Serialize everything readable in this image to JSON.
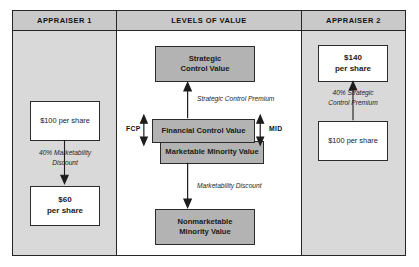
{
  "diagram": {
    "title": "Levels of Value",
    "columns": {
      "left_header": "APPRAISER 1",
      "center_header": "LEVELS OF VALUE",
      "right_header": "APPRAISER 2"
    },
    "colors": {
      "panel_gray": "#d9d9d9",
      "header_gray": "#c9c9c9",
      "box_gray": "#b3b3b3",
      "box_white": "#ffffff",
      "line": "#262626"
    },
    "center": {
      "strategic_line1": "Strategic",
      "strategic_line2": "Control Value",
      "financial_control": "Financial Control Value",
      "marketable_minority": "Marketable Minority Value",
      "nonmarketable_line1": "Nonmarketable",
      "nonmarketable_line2": "Minority Value",
      "annotation_premium": "Strategic Control Premium",
      "annotation_discount": "Marketability Discount",
      "label_left": "FCP",
      "label_right": "MID"
    },
    "appraiser1": {
      "top_value": "$100 per share",
      "annotation_line1": "40% Marketability",
      "annotation_line2": "Discount",
      "bottom_value_line1": "$60",
      "bottom_value_line2": "per share"
    },
    "appraiser2": {
      "top_value_line1": "$140",
      "top_value_line2": "per share",
      "annotation_line1": "40% Strategic",
      "annotation_line2": "Control Premium",
      "bottom_value": "$100 per share"
    }
  }
}
